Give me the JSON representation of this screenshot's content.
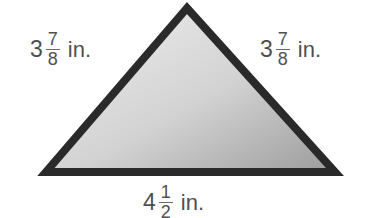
{
  "figure": {
    "type": "triangle",
    "colors": {
      "outline": "#2a2a2a",
      "fill_light": "#e4e4e4",
      "fill_dark": "#9a9a9a",
      "label_text": "#4f4f4f"
    },
    "vertices": {
      "apex": [
        187,
        5
      ],
      "bottom_left": [
        41,
        175
      ],
      "bottom_right": [
        340,
        175
      ]
    }
  },
  "labels": {
    "left_side": {
      "whole": "3",
      "numerator": "7",
      "denominator": "8",
      "unit": "in."
    },
    "right_side": {
      "whole": "3",
      "numerator": "7",
      "denominator": "8",
      "unit": "in."
    },
    "base": {
      "whole": "4",
      "numerator": "1",
      "denominator": "2",
      "unit": "in."
    }
  }
}
